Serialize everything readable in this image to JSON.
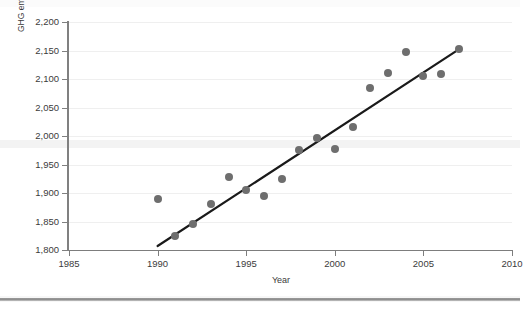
{
  "chart_data": {
    "type": "scatter",
    "title": "",
    "xlabel": "Year",
    "ylabel": "GHG emissions per capita (in kg of CO2 equivalent)",
    "ylabel_parts": {
      "pre": "GHG emissions per capita (in kg of CO",
      "sub": "2",
      "post": " equivalent)"
    },
    "xlim": [
      1985,
      2010
    ],
    "ylim": [
      1800,
      2200
    ],
    "xticks": [
      1985,
      1990,
      1995,
      2000,
      2005,
      2010
    ],
    "xtick_labels": [
      "1985",
      "1990",
      "1995",
      "2000",
      "2005",
      "2010"
    ],
    "yticks": [
      1800,
      1850,
      1900,
      1950,
      2000,
      2050,
      2100,
      2150,
      2200
    ],
    "ytick_labels": [
      "1,800",
      "1,850",
      "1,900",
      "1,950",
      "2,000",
      "2,050",
      "2,100",
      "2,150",
      "2,200"
    ],
    "grid": "horizontal",
    "legend": "none",
    "marker_color": "#6e6e6e",
    "trendline_color": "#1a1a1a",
    "series": [
      {
        "name": "GHG emissions per capita",
        "x": [
          1990,
          1991,
          1992,
          1993,
          1994,
          1995,
          1996,
          1997,
          1998,
          1999,
          2000,
          2001,
          2002,
          2003,
          2004,
          2005,
          2006,
          2007
        ],
        "y": [
          1890,
          1824,
          1845,
          1880,
          1928,
          1906,
          1894,
          1924,
          1975,
          1997,
          1978,
          2016,
          2085,
          2110,
          2147,
          2106,
          2109,
          2152
        ]
      }
    ],
    "trendline": {
      "type": "linear-fit",
      "x_start": 1990.0,
      "y_start": 1807,
      "x_end": 2007.0,
      "y_end": 2152
    }
  },
  "axes": {
    "x_title": "Year",
    "y_title_pre": "GHG emissions per capita (in kg of CO",
    "y_title_sub": "2",
    "y_title_post": " equivalent)"
  }
}
